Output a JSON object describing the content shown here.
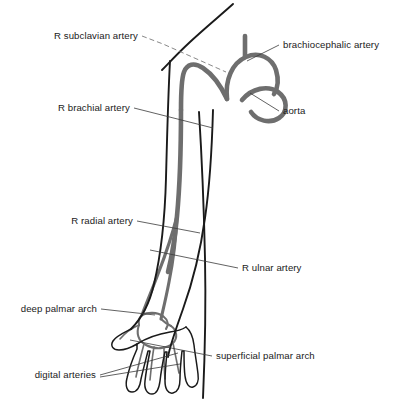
{
  "figure": {
    "background_color": "#ffffff",
    "vessel_color": "#6e6e6e",
    "outline_color": "#1a1a1a",
    "leader_color": "#3a3a3a",
    "width": 402,
    "height": 406
  },
  "labels": [
    {
      "id": "r-subclavian-artery",
      "text": "R subclavian artery",
      "x": 138,
      "y": 39,
      "align": "end"
    },
    {
      "id": "brachiocephalic-artery",
      "text": "brachiocephalic artery",
      "x": 283,
      "y": 48,
      "align": "start"
    },
    {
      "id": "aorta",
      "text": "aorta",
      "x": 283,
      "y": 114,
      "align": "start"
    },
    {
      "id": "r-brachial-artery",
      "text": "R brachial artery",
      "x": 130,
      "y": 111,
      "align": "end"
    },
    {
      "id": "r-radial-artery",
      "text": "R radial artery",
      "x": 133,
      "y": 224,
      "align": "end"
    },
    {
      "id": "r-ulnar-artery",
      "text": "R ulnar artery",
      "x": 242,
      "y": 271,
      "align": "start"
    },
    {
      "id": "deep-palmar-arch",
      "text": "deep palmar arch",
      "x": 97,
      "y": 312,
      "align": "end"
    },
    {
      "id": "superficial-palmar-arch",
      "text": "superficial palmar arch",
      "x": 216,
      "y": 359,
      "align": "start"
    },
    {
      "id": "digital-arteries",
      "text": "digital arteries",
      "x": 96,
      "y": 378,
      "align": "end"
    }
  ],
  "leaders": [
    {
      "id": "leader-r-subclavian-artery",
      "style": "dashed",
      "d": "M 142 36 L 163 44 L 226 72"
    },
    {
      "id": "leader-brachiocephalic-artery",
      "style": "solid",
      "d": "M 279 45 L 247 61"
    },
    {
      "id": "leader-aorta",
      "style": "solid",
      "d": "M 279 111 L 250 93"
    },
    {
      "id": "leader-r-brachial-artery",
      "style": "solid",
      "d": "M 134 108 L 213 128"
    },
    {
      "id": "leader-r-radial-artery",
      "style": "solid",
      "d": "M 137 221 L 200 233"
    },
    {
      "id": "leader-r-ulnar-artery",
      "style": "solid",
      "d": "M 238 268 L 150 250"
    },
    {
      "id": "leader-deep-palmar-arch",
      "style": "solid",
      "d": "M 101 309 L 155 315"
    },
    {
      "id": "leader-superficial-palmar-arch",
      "style": "solid",
      "d": "M 212 356 L 130 340"
    },
    {
      "id": "leader-digital-arteries-1",
      "style": "solid",
      "d": "M 100 375 L 178 353"
    },
    {
      "id": "leader-digital-arteries-2",
      "style": "solid",
      "d": "M 100 377 L 180 364"
    }
  ],
  "anatomy": {
    "body_outline": {
      "id": "neck-shoulder-outline",
      "d": "M 233 4 C 222 14 205 28 190 42 C 176 55 168 64 162 70"
    },
    "arm_outline_lateral": {
      "id": "arm-outline-lateral",
      "d": "M 170 61 C 168 98 167 140 166 178 C 165 216 162 250 154 284 C 149 306 141 319 131 329"
    },
    "arm_outline_medial": {
      "id": "arm-outline-medial",
      "d": "M 213 110 C 212 146 210 184 205 218 C 200 254 192 284 183 309 C 176 329 170 345 168 357"
    },
    "torso_outline": {
      "id": "torso-flank-outline",
      "d": "M 199 112 C 202 160 204 212 205 258 C 206 306 205 352 203 398"
    },
    "hand_outline": {
      "id": "hand-outline",
      "d": "M 131 329 C 123 333 116 336 113 341 C 110 346 113 350 119 350 C 125 350 132 347 137 344 L 137 349 C 133 358 129 369 127 378 C 125 386 127 392 132 392 C 137 392 140 387 141 379 C 143 370 146 359 148 351 L 150 351 C 148 361 146 372 145 381 C 144 389 147 394 152 394 C 157 394 159 389 160 381 C 161 372 163 361 165 352 L 167 352 C 166 362 165 372 165 381 C 165 389 168 394 173 393 C 178 392 180 387 180 379 C 180 370 181 360 182 351 L 184 351 C 184 360 184 369 185 376 C 186 384 189 388 193 387 C 197 386 199 381 198 374 C 197 365 195 354 194 345 C 193 337 191 331 186 327"
    },
    "wrist_outline": {
      "id": "wrist-outline",
      "d": "M 137 344 C 145 339 158 334 170 332 C 178 331 183 329 186 327"
    },
    "vessels": [
      {
        "id": "aortic-arch",
        "kind": "aorta",
        "d": "M 227 99 C 225 80 232 63 246 57 C 259 51 272 58 276 70 C 279 80 278 88 274 94"
      },
      {
        "id": "aorta-descending-hook",
        "kind": "aorta-hook",
        "d": "M 242 100 C 252 88 268 85 278 92 C 288 99 288 112 279 118 C 270 124 257 121 251 112"
      },
      {
        "id": "brachiocephalic-trunk",
        "kind": "branch",
        "d": "M 245 57 C 245 48 245 42 245 36"
      },
      {
        "id": "subclavian-to-brachial",
        "kind": "main",
        "d": "M 227 99 C 220 84 212 74 203 68 C 194 62 187 64 184 72 C 181 80 181 94 181 110"
      },
      {
        "id": "r-brachial-artery-vessel",
        "kind": "main",
        "d": "M 181 110 C 181 146 180 184 177 216 C 175 238 172 256 168 272"
      },
      {
        "id": "r-radial-artery-vessel",
        "kind": "mid",
        "d": "M 177 216 C 172 236 165 256 158 274 C 152 290 146 304 142 315"
      },
      {
        "id": "r-ulnar-artery-vessel",
        "kind": "mid",
        "d": "M 177 216 C 176 240 173 262 169 282 C 166 298 163 310 161 319"
      },
      {
        "id": "deep-palmar-arch-vessel",
        "kind": "thin",
        "d": "M 142 315 C 148 312 157 312 163 316 C 168 320 169 325 166 329"
      },
      {
        "id": "superficial-palmar-arch-vessel",
        "kind": "thin",
        "d": "M 139 325 C 136 333 138 341 146 345 C 155 350 167 349 173 343 C 178 338 177 330 171 326"
      },
      {
        "id": "radial-wrist-branch",
        "kind": "thin",
        "d": "M 142 315 C 139 318 138 321 139 325"
      },
      {
        "id": "ulnar-wrist-branch",
        "kind": "thin",
        "d": "M 161 319 C 164 322 167 324 171 326"
      },
      {
        "id": "digital-artery-1",
        "kind": "fine",
        "d": "M 144 344 C 141 355 138 367 136 377"
      },
      {
        "id": "digital-artery-2",
        "kind": "fine",
        "d": "M 154 347 C 152 358 151 370 150 380"
      },
      {
        "id": "digital-artery-3",
        "kind": "fine",
        "d": "M 164 347 C 164 358 164 369 165 379"
      },
      {
        "id": "digital-artery-4",
        "kind": "fine",
        "d": "M 173 343 C 175 353 177 363 179 373"
      },
      {
        "id": "thumb-branch",
        "kind": "fine",
        "d": "M 139 325 C 132 328 125 333 120 339"
      }
    ]
  }
}
